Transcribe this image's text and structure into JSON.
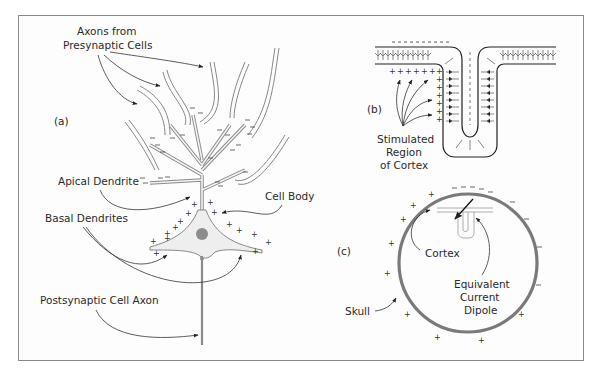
{
  "figure": {
    "panels": [
      {
        "id": "a",
        "label": "(a)"
      },
      {
        "id": "b",
        "label": "(b)"
      },
      {
        "id": "c",
        "label": "(c)"
      }
    ]
  },
  "panel_a": {
    "label": "(a)",
    "annotations": {
      "axons_line1": "Axons from",
      "axons_line2": "Presynaptic Cells",
      "apical_dendrite": "Apical Dendrite",
      "basal_dendrites": "Basal Dendrites",
      "cell_body": "Cell Body",
      "postsynaptic_axon": "Postsynaptic Cell Axon"
    },
    "charges": {
      "top_region": "-",
      "soma_region": "+"
    }
  },
  "panel_b": {
    "label": "(b)",
    "annotations": {
      "stimulated_line1": "Stimulated",
      "stimulated_line2": "Region",
      "stimulated_line3": "of Cortex"
    },
    "charges": {
      "surface": "-",
      "inner": "+"
    }
  },
  "panel_c": {
    "label": "(c)",
    "annotations": {
      "cortex": "Cortex",
      "dipole_line1": "Equivalent",
      "dipole_line2": "Current",
      "dipole_line3": "Dipole",
      "skull": "Skull"
    },
    "charges": {
      "top_right": "-",
      "left_bottom": "+"
    }
  },
  "colors": {
    "frame": "#8a8a8a",
    "line": "#333333",
    "dendrite_fill": "#bdbdbd",
    "soma_fill": "#eeeeee",
    "nucleus": "#8c8c8c",
    "skull": "#7a7a7a"
  }
}
